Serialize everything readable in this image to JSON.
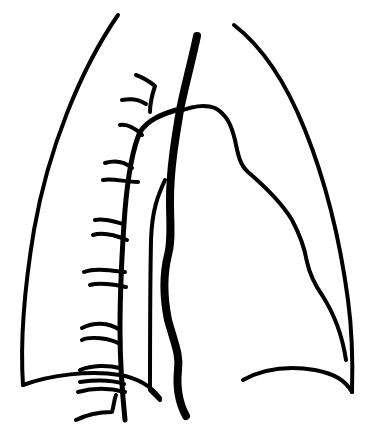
{
  "figure": {
    "type": "line-drawing",
    "background_color": "#ffffff",
    "stroke_color": "#000000",
    "width": 377,
    "height": 436
  }
}
